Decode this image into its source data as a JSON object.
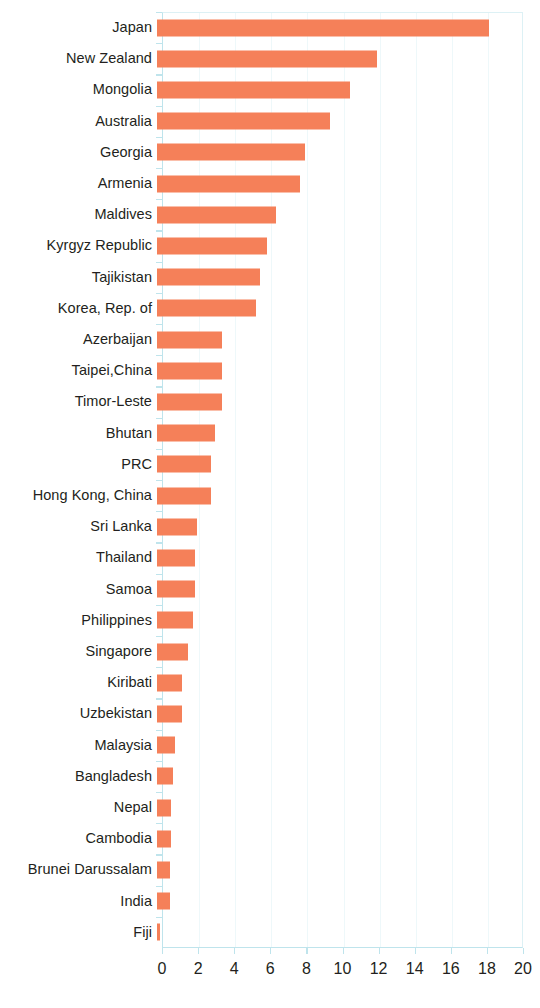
{
  "chart_data": {
    "type": "bar",
    "orientation": "horizontal",
    "title": "",
    "subtitle": "",
    "xlabel": "",
    "ylabel": "",
    "xlim": [
      0,
      20
    ],
    "xticks": [
      0,
      2,
      4,
      6,
      8,
      10,
      12,
      14,
      16,
      18,
      20
    ],
    "grid": true,
    "legend": null,
    "bar_color": "#f58059",
    "axis_color": "#bfe4ec",
    "text_color": "#231f20",
    "categories": [
      "Japan",
      "New Zealand",
      "Mongolia",
      "Australia",
      "Georgia",
      "Armenia",
      "Maldives",
      "Kyrgyz Republic",
      "Tajikistan",
      "Korea, Rep. of",
      "Azerbaijan",
      "Taipei,China",
      "Timor-Leste",
      "Bhutan",
      "PRC",
      "Hong Kong, China",
      "Sri Lanka",
      "Thailand",
      "Samoa",
      "Philippines",
      "Singapore",
      "Kiribati",
      "Uzbekistan",
      "Malaysia",
      "Bangladesh",
      "Nepal",
      "Cambodia",
      "Brunei Darussalam",
      "India",
      "Fiji"
    ],
    "values": [
      18.4,
      12.2,
      10.7,
      9.6,
      8.2,
      7.9,
      6.6,
      6.1,
      5.7,
      5.5,
      3.6,
      3.6,
      3.6,
      3.2,
      3.0,
      3.0,
      2.2,
      2.1,
      2.1,
      2.0,
      1.7,
      1.4,
      1.4,
      1.0,
      0.9,
      0.8,
      0.8,
      0.7,
      0.7,
      0.15
    ]
  }
}
